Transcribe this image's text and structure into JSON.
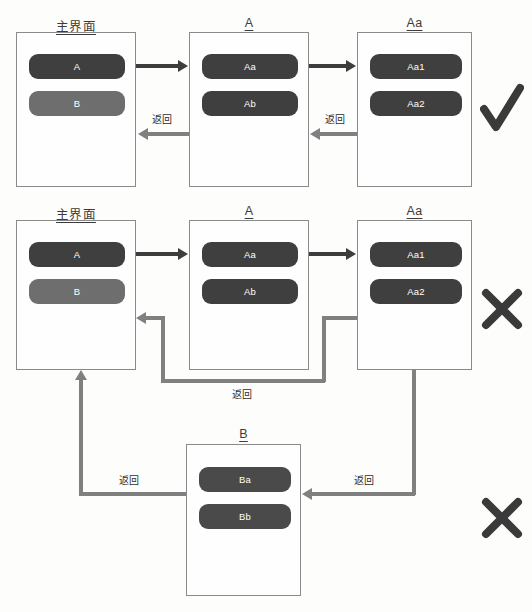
{
  "diagram": {
    "title_text_color": "#3b3b3b",
    "accent_dark": "#3f3f3f",
    "accent_grey": "#6e6e6e",
    "connector_grey": "#808080",
    "connector_dark": "#3d3d3d",
    "back_label": "返回"
  },
  "rows": [
    {
      "id": "row-good",
      "verdict": "check",
      "panels": [
        {
          "id": "home",
          "title": "主界面",
          "buttons": [
            {
              "label": "A",
              "style": "dark"
            },
            {
              "label": "B",
              "style": "grey"
            }
          ]
        },
        {
          "id": "a",
          "title": "A",
          "buttons": [
            {
              "label": "Aa",
              "style": "dark"
            },
            {
              "label": "Ab",
              "style": "dark"
            }
          ]
        },
        {
          "id": "aa",
          "title": "Aa",
          "buttons": [
            {
              "label": "Aa1",
              "style": "dark"
            },
            {
              "label": "Aa2",
              "style": "dark"
            }
          ]
        }
      ],
      "back_labels": [
        "返回",
        "返回"
      ]
    },
    {
      "id": "row-bad-1",
      "verdict": "cross",
      "panels": [
        {
          "id": "home2",
          "title": "主界面",
          "buttons": [
            {
              "label": "A",
              "style": "dark"
            },
            {
              "label": "B",
              "style": "grey"
            }
          ]
        },
        {
          "id": "a2",
          "title": "A",
          "buttons": [
            {
              "label": "Aa",
              "style": "dark"
            },
            {
              "label": "Ab",
              "style": "dark"
            }
          ]
        },
        {
          "id": "aa2",
          "title": "Aa",
          "buttons": [
            {
              "label": "Aa1",
              "style": "dark"
            },
            {
              "label": "Aa2",
              "style": "dark"
            }
          ]
        }
      ],
      "back_labels": [
        "返回"
      ]
    },
    {
      "id": "row-bad-2",
      "verdict": "cross",
      "panels": [
        {
          "id": "b",
          "title": "B",
          "buttons": [
            {
              "label": "Ba",
              "style": "mid"
            },
            {
              "label": "Bb",
              "style": "mid"
            }
          ]
        }
      ],
      "back_labels": [
        "返回",
        "返回"
      ]
    }
  ],
  "verdicts": {
    "check_name": "check-mark",
    "cross_name": "cross-mark"
  }
}
